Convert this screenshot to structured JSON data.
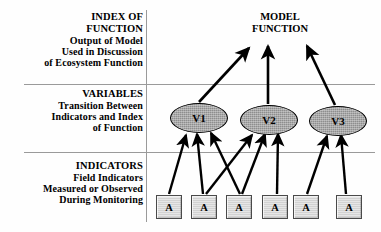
{
  "diagram": {
    "title": "MODEL FUNCTION",
    "title_lines": [
      "MODEL",
      "FUNCTION"
    ],
    "tiers": [
      {
        "id": "index-of-function",
        "heading_lines": [
          "INDEX OF",
          "FUNCTION"
        ],
        "description_lines": [
          "Output of Model",
          "Used in Discussion",
          "of Ecosystem Function"
        ]
      },
      {
        "id": "variables",
        "heading_lines": [
          "VARIABLES"
        ],
        "description_lines": [
          "Transition Between",
          "Indicators and Index",
          "of Function"
        ]
      },
      {
        "id": "indicators",
        "heading_lines": [
          "INDICATORS"
        ],
        "description_lines": [
          "Field Indicators",
          "Measured or Observed",
          "During Monitoring"
        ]
      }
    ],
    "variables": [
      {
        "label": "V1",
        "cx": 198,
        "cy": 117,
        "rx": 28,
        "ry": 14
      },
      {
        "label": "V2",
        "cx": 268,
        "cy": 119,
        "rx": 28,
        "ry": 14
      },
      {
        "label": "V3",
        "cx": 337,
        "cy": 120,
        "rx": 28,
        "ry": 14
      }
    ],
    "indicators": [
      {
        "label": "A",
        "cx": 168,
        "cy": 206
      },
      {
        "label": "A",
        "cx": 203,
        "cy": 206
      },
      {
        "label": "A",
        "cx": 238,
        "cy": 206
      },
      {
        "label": "A",
        "cx": 274,
        "cy": 206
      },
      {
        "label": "A",
        "cx": 305,
        "cy": 206
      },
      {
        "label": "A",
        "cx": 348,
        "cy": 206
      }
    ],
    "arrows_to_model": [
      {
        "from": "V1",
        "x1": 199,
        "y1": 102,
        "x2": 249,
        "y2": 48
      },
      {
        "from": "V2",
        "x1": 268,
        "y1": 104,
        "x2": 268,
        "y2": 46
      },
      {
        "from": "V3",
        "x1": 335,
        "y1": 105,
        "x2": 307,
        "y2": 46
      }
    ],
    "arrows_to_variables": [
      {
        "from_indicator": 1,
        "to_variable": "V1",
        "x1": 169,
        "y1": 194,
        "x2": 186,
        "y2": 135
      },
      {
        "from_indicator": 2,
        "to_variable": "V1",
        "x1": 203,
        "y1": 194,
        "x2": 197,
        "y2": 134
      },
      {
        "from_indicator": 3,
        "to_variable": "V1",
        "x1": 240,
        "y1": 194,
        "x2": 211,
        "y2": 133
      },
      {
        "from_indicator": 3,
        "to_variable": "V2",
        "x1": 206,
        "y1": 194,
        "x2": 252,
        "y2": 135
      },
      {
        "from_indicator": 4,
        "to_variable": "V2",
        "x1": 242,
        "y1": 194,
        "x2": 265,
        "y2": 134
      },
      {
        "from_indicator": 5,
        "to_variable": "V2",
        "x1": 277,
        "y1": 194,
        "x2": 278,
        "y2": 134
      },
      {
        "from_indicator": 5,
        "to_variable": "V3",
        "x1": 307,
        "y1": 194,
        "x2": 327,
        "y2": 136
      },
      {
        "from_indicator": 6,
        "to_variable": "V3",
        "x1": 346,
        "y1": 194,
        "x2": 341,
        "y2": 135
      }
    ],
    "dividers": {
      "vertical_x": 146,
      "horizontal_y": [
        84,
        152
      ]
    },
    "colors": {
      "rule": "#9a9a9a",
      "ellipse_fill": "#8e8e8e",
      "ellipse_stroke": "#000000",
      "box_fill": "#d2d2d2",
      "box_stroke": "#4a4a4a",
      "arrow": "#000000",
      "text": "#000000",
      "background": "#ffffff"
    }
  }
}
